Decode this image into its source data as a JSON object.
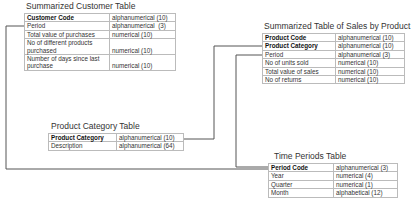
{
  "diagram": {
    "tables": [
      {
        "id": "customer",
        "title": "Summarized Customer Table",
        "rows": [
          {
            "field": "Customer Code",
            "type": "alphanumerical (10)",
            "key": true
          },
          {
            "field": "Period",
            "type": "alphanumerical  (3)",
            "key": false
          },
          {
            "field": "Total value of purchases",
            "type": "numerical (10)",
            "key": false
          },
          {
            "field": "No of different products",
            "type": "",
            "key": false
          },
          {
            "field": "purchased",
            "type": "numerical (10)",
            "key": false
          },
          {
            "field": "Number of days since last",
            "type": "",
            "key": false
          },
          {
            "field": "purchase",
            "type": "numerical (10)",
            "key": false
          }
        ]
      },
      {
        "id": "sales",
        "title": "Summarized Table of Sales by Product",
        "rows": [
          {
            "field": "Product Code",
            "type": "alphanumerical (10)",
            "key": true
          },
          {
            "field": "Product Category",
            "type": "alphanumerical (10)",
            "key": true
          },
          {
            "field": "Period",
            "type": "alphanumerical (3)",
            "key": false
          },
          {
            "field": "No of units sold",
            "type": "numerical (10)",
            "key": false
          },
          {
            "field": "Total value of sales",
            "type": "numerical (10)",
            "key": false
          },
          {
            "field": "No of returns",
            "type": "numerical (10)",
            "key": false
          }
        ]
      },
      {
        "id": "category",
        "title": "Product Category Table",
        "rows": [
          {
            "field": "Product Category",
            "type": "alphanumerical (10)",
            "key": true
          },
          {
            "field": "Description",
            "type": "alphanumerical (64)",
            "key": false
          }
        ]
      },
      {
        "id": "periods",
        "title": "Time Periods Table",
        "rows": [
          {
            "field": "Period Code",
            "type": "alphanumerical (3)",
            "key": true
          },
          {
            "field": "Year",
            "type": "numerical (4)",
            "key": false
          },
          {
            "field": "Quarter",
            "type": "numerical (1)",
            "key": false
          },
          {
            "field": "Month",
            "type": "alphabetical (12)",
            "key": false
          }
        ]
      }
    ],
    "relationships": [
      {
        "from": "customer.Period",
        "to": "periods.Period Code"
      },
      {
        "from": "sales.Product Category",
        "to": "category.Product Category"
      },
      {
        "from": "sales.Period",
        "to": "periods.Period Code"
      }
    ],
    "colors": {
      "line": "#555555",
      "border": "#666666",
      "cell_border": "#bbbbbb"
    }
  }
}
